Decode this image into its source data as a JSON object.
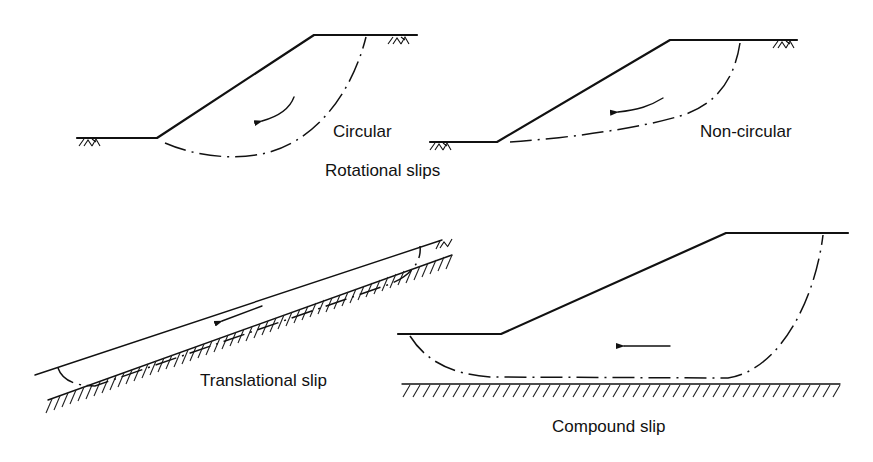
{
  "figure": {
    "type": "slope failure mechanisms diagram",
    "panels": [
      {
        "id": "circular",
        "label": "Circular",
        "group": "rotational",
        "slip_surface": "circular arc",
        "movement": "rotational"
      },
      {
        "id": "non-circular",
        "label": "Non-circular",
        "group": "rotational",
        "slip_surface": "non-circular curve",
        "movement": "rotational"
      },
      {
        "id": "translational",
        "label": "Translational slip",
        "slip_surface": "planar, parallel to slope",
        "movement": "downslope translation"
      },
      {
        "id": "compound",
        "label": "Compound slip",
        "slip_surface": "curved ends with flat base on firm stratum",
        "movement": "horizontal"
      }
    ],
    "group_labels": {
      "rotational": "Rotational slips"
    },
    "colors": {
      "ink": "#111111",
      "background": "#ffffff"
    }
  }
}
